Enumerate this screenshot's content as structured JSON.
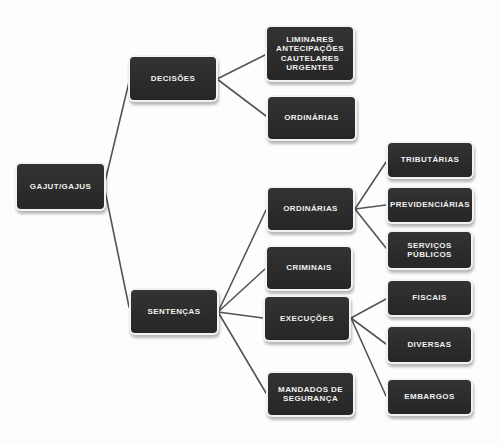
{
  "diagram": {
    "type": "tree",
    "colors": {
      "background": "#fdfdfd",
      "node_fill": "#2b2b2b",
      "node_text": "#f0f0f0",
      "connector": "#555555"
    },
    "nodes": {
      "root": {
        "label": "GAJUT/GAJUS",
        "x": 17,
        "y": 164,
        "w": 87,
        "h": 45
      },
      "decisoes": {
        "label": "DECISÕES",
        "x": 130,
        "y": 57,
        "w": 86,
        "h": 43
      },
      "decisoes_urgentes": {
        "label": "LIMINARES\nANTECIPAÇÕES\nCAUTELARES\nURGENTES",
        "x": 267,
        "y": 27,
        "w": 86,
        "h": 53
      },
      "decisoes_ordinarias": {
        "label": "ORDINÁRIAS",
        "x": 268,
        "y": 97,
        "w": 87,
        "h": 42
      },
      "sentencas": {
        "label": "SENTENÇAS",
        "x": 131,
        "y": 290,
        "w": 86,
        "h": 43
      },
      "sentencas_ordinarias": {
        "label": "ORDINÁRIAS",
        "x": 268,
        "y": 188,
        "w": 85,
        "h": 42
      },
      "criminais": {
        "label": "CRIMINAIS",
        "x": 267,
        "y": 247,
        "w": 84,
        "h": 42
      },
      "execucoes": {
        "label": "EXECUÇÕES",
        "x": 265,
        "y": 297,
        "w": 84,
        "h": 43
      },
      "mandados": {
        "label": "MANDADOS DE\nSEGURANÇA",
        "x": 268,
        "y": 373,
        "w": 85,
        "h": 42
      },
      "tributarias": {
        "label": "TRIBUTÁRIAS",
        "x": 388,
        "y": 143,
        "w": 84,
        "h": 34
      },
      "previdenciarias": {
        "label": "PREVIDENCIÁRIAS",
        "x": 388,
        "y": 188,
        "w": 84,
        "h": 34
      },
      "servicos_publicos": {
        "label": "SERVIÇOS\nPÚBLICOS",
        "x": 388,
        "y": 232,
        "w": 83,
        "h": 36
      },
      "fiscais": {
        "label": "FISCAIS",
        "x": 388,
        "y": 281,
        "w": 83,
        "h": 34
      },
      "diversas": {
        "label": "DIVERSAS",
        "x": 388,
        "y": 327,
        "w": 83,
        "h": 35
      },
      "embargos": {
        "label": "EMBARGOS",
        "x": 388,
        "y": 380,
        "w": 83,
        "h": 34
      }
    },
    "edges": [
      {
        "from": "root",
        "to": "decisoes",
        "x1": 104,
        "y1": 186,
        "x2": 129,
        "y2": 82
      },
      {
        "from": "root",
        "to": "sentencas",
        "x1": 104,
        "y1": 186,
        "x2": 129,
        "y2": 307
      },
      {
        "from": "decisoes",
        "to": "decisoes_urgentes",
        "x1": 217,
        "y1": 79,
        "x2": 265,
        "y2": 55
      },
      {
        "from": "decisoes",
        "to": "decisoes_ordinarias",
        "x1": 217,
        "y1": 79,
        "x2": 266,
        "y2": 116
      },
      {
        "from": "sentencas",
        "to": "sentencas_ordinarias",
        "x1": 218,
        "y1": 312,
        "x2": 266,
        "y2": 210
      },
      {
        "from": "sentencas",
        "to": "criminais",
        "x1": 218,
        "y1": 312,
        "x2": 265,
        "y2": 269
      },
      {
        "from": "sentencas",
        "to": "execucoes",
        "x1": 218,
        "y1": 312,
        "x2": 263,
        "y2": 318
      },
      {
        "from": "sentencas",
        "to": "mandados",
        "x1": 218,
        "y1": 312,
        "x2": 266,
        "y2": 393
      },
      {
        "from": "sentencas_ordinarias",
        "to": "tributarias",
        "x1": 355,
        "y1": 209,
        "x2": 386,
        "y2": 162
      },
      {
        "from": "sentencas_ordinarias",
        "to": "previdenciarias",
        "x1": 355,
        "y1": 209,
        "x2": 386,
        "y2": 205
      },
      {
        "from": "sentencas_ordinarias",
        "to": "servicos_publicos",
        "x1": 355,
        "y1": 209,
        "x2": 386,
        "y2": 248
      },
      {
        "from": "execucoes",
        "to": "fiscais",
        "x1": 351,
        "y1": 318,
        "x2": 386,
        "y2": 299
      },
      {
        "from": "execucoes",
        "to": "diversas",
        "x1": 351,
        "y1": 318,
        "x2": 386,
        "y2": 344
      },
      {
        "from": "execucoes",
        "to": "embargos",
        "x1": 351,
        "y1": 318,
        "x2": 386,
        "y2": 396
      }
    ]
  }
}
